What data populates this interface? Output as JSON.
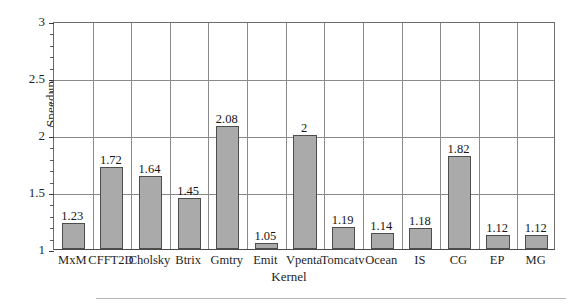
{
  "chart_data": {
    "type": "bar",
    "title": "",
    "xlabel": "Kernel",
    "ylabel": "Speedup",
    "categories": [
      "MxM",
      "CFFT2D",
      "Cholsky",
      "Btrix",
      "Gmtry",
      "Emit",
      "Vpenta",
      "Tomcatv",
      "Ocean",
      "IS",
      "CG",
      "EP",
      "MG"
    ],
    "values": [
      1.23,
      1.72,
      1.64,
      1.45,
      2.08,
      1.05,
      2,
      1.19,
      1.14,
      1.18,
      1.82,
      1.12,
      1.12
    ],
    "value_labels": [
      "1.23",
      "1.72",
      "1.64",
      "1.45",
      "2.08",
      "1.05",
      "2",
      "1.19",
      "1.14",
      "1.18",
      "1.82",
      "1.12",
      "1.12"
    ],
    "ylim": [
      1,
      3
    ],
    "ytick_labels": [
      "1",
      "1.5",
      "2",
      "2.5",
      "3"
    ],
    "ytick_values": [
      1,
      1.5,
      2,
      2.5,
      3
    ],
    "minor_tick_step": 0.1,
    "grid": "both",
    "legend": "none",
    "bar_color": "#aaaaaa",
    "bar_edge_color": "#4d4d4d",
    "grid_color": "#8a8a8a"
  }
}
